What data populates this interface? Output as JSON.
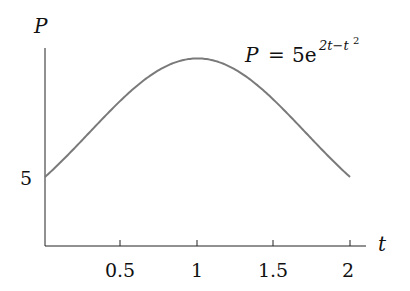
{
  "chart_data": {
    "type": "line",
    "title": "",
    "annotation": {
      "text": "P = 5e^{2t−t²}",
      "base": "P = 5e",
      "exponent": "2t−t",
      "exponent_power": "2"
    },
    "xlabel": "t",
    "ylabel": "P",
    "xlim": [
      0,
      2.1
    ],
    "ylim": [
      0,
      14.3
    ],
    "x_ticks": [
      0.5,
      1,
      1.5,
      2
    ],
    "x_tick_labels": [
      "0.5",
      "1",
      "1.5",
      "2"
    ],
    "y_ticks": [
      5
    ],
    "y_tick_labels": [
      "5"
    ],
    "grid": false,
    "legend": null,
    "series": [
      {
        "name": "P = 5e^(2t - t^2)",
        "color": "#7a7a7a",
        "x": [
          0,
          0.25,
          0.5,
          0.75,
          1,
          1.25,
          1.5,
          1.75,
          2
        ],
        "y": [
          5.0,
          7.76,
          10.59,
          12.73,
          13.59,
          12.73,
          10.59,
          7.76,
          5.0
        ]
      }
    ]
  },
  "labels": {
    "y_axis": "P",
    "x_axis": "t",
    "y_tick_5": "5",
    "x_tick_0_5": "0.5",
    "x_tick_1": "1",
    "x_tick_1_5": "1.5",
    "x_tick_2": "2",
    "eq_lhs": "P",
    "eq_eq": "=",
    "eq_coef": "5e",
    "eq_exp": "2t−t",
    "eq_exp_sq": "2"
  }
}
